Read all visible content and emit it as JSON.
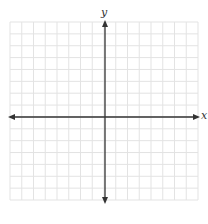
{
  "diagram": {
    "type": "coordinate-plane",
    "axes": {
      "x_label": "x",
      "y_label": "y",
      "color": "#333333"
    },
    "grid": {
      "left": 10,
      "top": 22,
      "right": 198,
      "bottom": 200,
      "cell": 11.75,
      "columns": 16,
      "rows": 15,
      "color": "#e3e3e3"
    },
    "origin": {
      "px_x": 105,
      "px_y": 117
    }
  }
}
